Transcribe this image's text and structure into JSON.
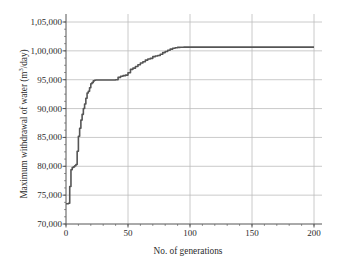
{
  "chart_data": {
    "type": "line",
    "title": "",
    "xlabel": "No. of generations",
    "ylabel": "Maximum withdrawal of water (m",
    "ylabel_sup": "3",
    "ylabel_tail": "/day)",
    "ylabel_full": "Maximum withdrawal of water (m3/day)",
    "xlim": [
      0,
      200
    ],
    "ylim": [
      70000,
      105000
    ],
    "grid": true,
    "legend": null,
    "xticks": [
      0,
      50,
      100,
      150,
      200
    ],
    "xtick_labels": [
      "0",
      "50",
      "100",
      "150",
      "200"
    ],
    "yticks": [
      70000,
      75000,
      80000,
      85000,
      90000,
      95000,
      100000,
      105000
    ],
    "ytick_labels": [
      "70,000",
      "75,000",
      "80,000",
      "85,000",
      "90,000",
      "95,000",
      "1,00,000",
      "1,05,000"
    ],
    "x_minor_tick_step": 10,
    "y_minor_tick_step": 1250,
    "series": [
      {
        "name": "Maximum withdrawal of water",
        "color": "#555555",
        "line_width": 1.6,
        "x": [
          0,
          1,
          2,
          3,
          4,
          5,
          6,
          7,
          8,
          9,
          10,
          11,
          12,
          13,
          14,
          15,
          16,
          17,
          18,
          19,
          20,
          21,
          22,
          23,
          24,
          25,
          30,
          35,
          40,
          42,
          44,
          46,
          48,
          50,
          52,
          54,
          56,
          58,
          60,
          62,
          64,
          66,
          68,
          70,
          72,
          74,
          76,
          78,
          80,
          82,
          84,
          86,
          88,
          90,
          92,
          94,
          95,
          100,
          110,
          120,
          130,
          140,
          150,
          160,
          170,
          180,
          190,
          200
        ],
        "y": [
          73500,
          73500,
          73600,
          76500,
          79400,
          79800,
          79900,
          80100,
          80300,
          82600,
          85200,
          86600,
          88000,
          89000,
          90000,
          90800,
          91800,
          92700,
          93000,
          93600,
          94300,
          94500,
          94800,
          94900,
          94950,
          94950,
          94950,
          94950,
          95000,
          95400,
          95600,
          95700,
          95800,
          96200,
          96800,
          97000,
          97300,
          97600,
          97900,
          98100,
          98400,
          98600,
          98700,
          99000,
          99100,
          99200,
          99400,
          99700,
          99900,
          100100,
          100300,
          100450,
          100550,
          100600,
          100620,
          100630,
          100640,
          100640,
          100640,
          100640,
          100640,
          100640,
          100640,
          100640,
          100640,
          100640,
          100640,
          100640
        ]
      }
    ],
    "colors": {
      "line": "#555555",
      "grid": "#bdbdbd",
      "axis": "#555555",
      "text": "#2b2b2b",
      "background": "#ffffff"
    }
  }
}
